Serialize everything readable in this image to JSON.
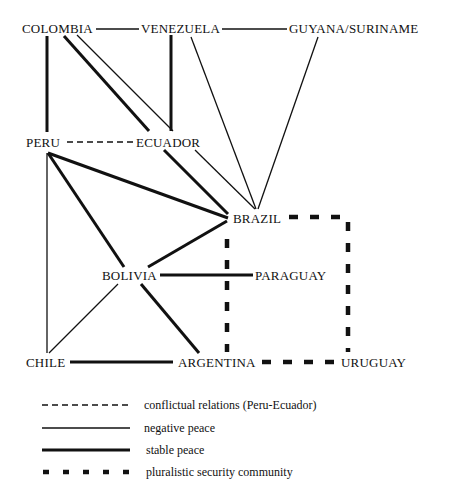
{
  "nodes": {
    "colombia": "COLOMBIA",
    "venezuela": "VENEZUELA",
    "guyana_suriname": "GUYANA/SURINAME",
    "peru": "PERU",
    "ecuador": "ECUADOR",
    "brazil": "BRAZIL",
    "bolivia": "BOLIVIA",
    "paraguay": "PARAGUAY",
    "chile": "CHILE",
    "argentina": "ARGENTINA",
    "uruguay": "URUGUAY"
  },
  "edges": [
    {
      "from": "COLOMBIA",
      "to": "VENEZUELA",
      "type": "negative peace"
    },
    {
      "from": "VENEZUELA",
      "to": "GUYANA/SURINAME",
      "type": "negative peace"
    },
    {
      "from": "COLOMBIA",
      "to": "PERU",
      "type": "stable peace"
    },
    {
      "from": "COLOMBIA",
      "to": "ECUADOR",
      "type": "stable peace"
    },
    {
      "from": "COLOMBIA",
      "to": "BRAZIL",
      "type": "negative peace"
    },
    {
      "from": "VENEZUELA",
      "to": "ECUADOR",
      "type": "stable peace"
    },
    {
      "from": "VENEZUELA",
      "to": "BRAZIL",
      "type": "negative peace"
    },
    {
      "from": "GUYANA/SURINAME",
      "to": "BRAZIL",
      "type": "negative peace"
    },
    {
      "from": "PERU",
      "to": "ECUADOR",
      "type": "conflictual relations (Peru-Ecuador)"
    },
    {
      "from": "ECUADOR",
      "to": "BRAZIL",
      "type": "stable peace"
    },
    {
      "from": "PERU",
      "to": "BRAZIL",
      "type": "stable peace"
    },
    {
      "from": "PERU",
      "to": "BOLIVIA",
      "type": "stable peace"
    },
    {
      "from": "PERU",
      "to": "CHILE",
      "type": "negative peace"
    },
    {
      "from": "BRAZIL",
      "to": "BOLIVIA",
      "type": "stable peace"
    },
    {
      "from": "BOLIVIA",
      "to": "PARAGUAY",
      "type": "stable peace"
    },
    {
      "from": "BOLIVIA",
      "to": "CHILE",
      "type": "negative peace"
    },
    {
      "from": "BOLIVIA",
      "to": "ARGENTINA",
      "type": "stable peace"
    },
    {
      "from": "CHILE",
      "to": "ARGENTINA",
      "type": "stable peace"
    },
    {
      "from": "BRAZIL",
      "to": "ARGENTINA",
      "type": "pluralistic security community"
    },
    {
      "from": "BRAZIL",
      "to": "URUGUAY",
      "type": "pluralistic security community"
    },
    {
      "from": "ARGENTINA",
      "to": "URUGUAY",
      "type": "pluralistic security community"
    }
  ],
  "legend": {
    "items": [
      {
        "style": "dashed-thin",
        "label": "conflictual relations (Peru-Ecuador)"
      },
      {
        "style": "solid-thin",
        "label": "negative peace"
      },
      {
        "style": "solid-thick",
        "label": "stable peace"
      },
      {
        "style": "dashed-thick",
        "label": "pluralistic security community"
      }
    ]
  },
  "colors": {
    "ink": "#111111",
    "background": "#ffffff"
  }
}
